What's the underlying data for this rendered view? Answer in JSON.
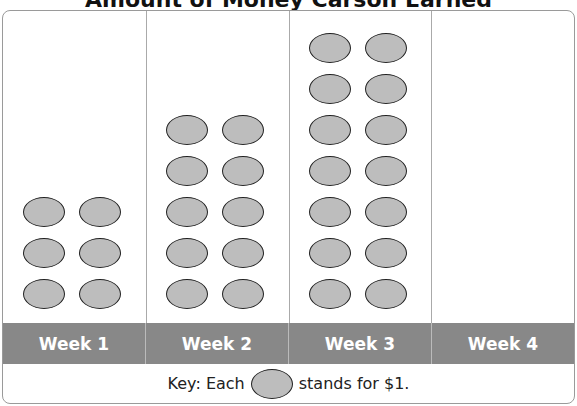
{
  "chart_data": {
    "type": "pictograph",
    "title": "Amount of Money Carson Earned",
    "categories": [
      "Week 1",
      "Week 2",
      "Week 3",
      "Week 4"
    ],
    "values": [
      6,
      10,
      14,
      0
    ],
    "key": {
      "prefix": "Key: Each",
      "suffix": "stands for $1.",
      "unit_value": 1
    },
    "colors": {
      "coin_fill": "#bdbdbd",
      "label_bar": "#888888"
    }
  }
}
